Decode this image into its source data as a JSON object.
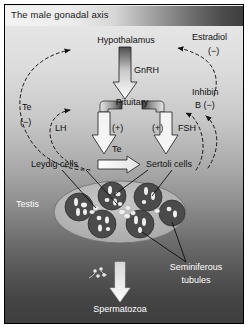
{
  "figure": {
    "title": "The male gonadal axis",
    "border_color": "#000000",
    "background": "vertical gray gradient light-to-dark"
  },
  "nodes": {
    "hypothalamus": "Hypothalamus",
    "pituitary": "Pituitary",
    "leydig": "Leydig cells",
    "sertoli": "Sertoli cells",
    "testis": "Testis",
    "spermatozoa": "Spermatozoa",
    "seminiferous_line1": "Seminiferous",
    "seminiferous_line2": "tubules"
  },
  "hormones": {
    "gnrh": "GnRH",
    "lh": "LH",
    "fsh": "FSH",
    "te_transfer": "Te",
    "lh_sign": "(+)",
    "fsh_sign": "(+)"
  },
  "feedback": {
    "testosterone_label": "Te",
    "testosterone_sign": "(−)",
    "estradiol_label": "Estradiol",
    "estradiol_sign": "(−)",
    "inhibin_line1": "Inhibin",
    "inhibin_line2": "B (−)"
  },
  "colors": {
    "arrow_fill": "#f2f2f2",
    "arrow_stroke": "#222222",
    "tubule_fill": "#4a4a4a",
    "testis_fill": "#b9b9b9",
    "dashed_stroke": "#1d1d1d",
    "title_text": "#1a1a1a",
    "dark_text": "#111111",
    "light_text": "#ffffff"
  }
}
